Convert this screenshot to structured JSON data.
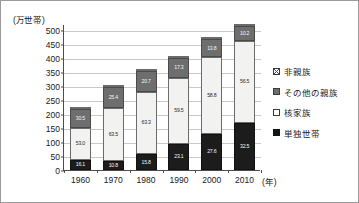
{
  "chart_data": {
    "type": "bar",
    "stacked": true,
    "title": "",
    "xlabel": "(年)",
    "ylabel": "(万世帯)",
    "categories": [
      "1960",
      "1970",
      "1980",
      "1990",
      "2000",
      "2010"
    ],
    "ylim": [
      0,
      500
    ],
    "yticks": [
      "0",
      "50",
      "100",
      "150",
      "200",
      "250",
      "300",
      "350",
      "400",
      "450",
      "500"
    ],
    "grid": true,
    "legend_position": "right",
    "totals": [
      225,
      303,
      360,
      405,
      473,
      520
    ],
    "series": [
      {
        "name": "単独世帯",
        "key": "tandoku",
        "color": "#1c1c1c",
        "values": [
          16.1,
          10.8,
          15.8,
          23.1,
          27.6,
          32.5
        ],
        "labels": [
          "16.1",
          "10.8",
          "15.8",
          "23.1",
          "27.6",
          "32.5"
        ]
      },
      {
        "name": "核家族",
        "key": "kaku",
        "color": "#f2f2f0",
        "values": [
          53.0,
          63.5,
          63.3,
          59.5,
          58.8,
          56.5
        ],
        "labels": [
          "53.0",
          "63.5",
          "63.3",
          "59.5",
          "58.8",
          "56.5"
        ]
      },
      {
        "name": "その他の親族",
        "key": "sonota",
        "color": "#6e6e6e",
        "values": [
          30.5,
          25.4,
          20.7,
          17.3,
          13.8,
          10.2
        ],
        "labels": [
          "30.5",
          "25.4",
          "20.7",
          "17.3",
          "13.8",
          "10.2"
        ]
      },
      {
        "name": "非親族",
        "key": "hishinzoku",
        "color": "#ffffff",
        "values": [
          0.3,
          0.3,
          0.2,
          0.2,
          0.6,
          0.9
        ],
        "labels": [
          "0.3",
          "0.3",
          "0.2",
          "0.2",
          "0.6",
          "0.9"
        ]
      }
    ]
  },
  "axis": {
    "y_unit": "(万世帯)",
    "x_unit": "(年)"
  },
  "legend": {
    "items": [
      {
        "label": "非親族",
        "key": "hishinzoku"
      },
      {
        "label": "その他の親族",
        "key": "sonota"
      },
      {
        "label": "核家族",
        "key": "kaku"
      },
      {
        "label": "単独世帯",
        "key": "tandoku"
      }
    ]
  }
}
